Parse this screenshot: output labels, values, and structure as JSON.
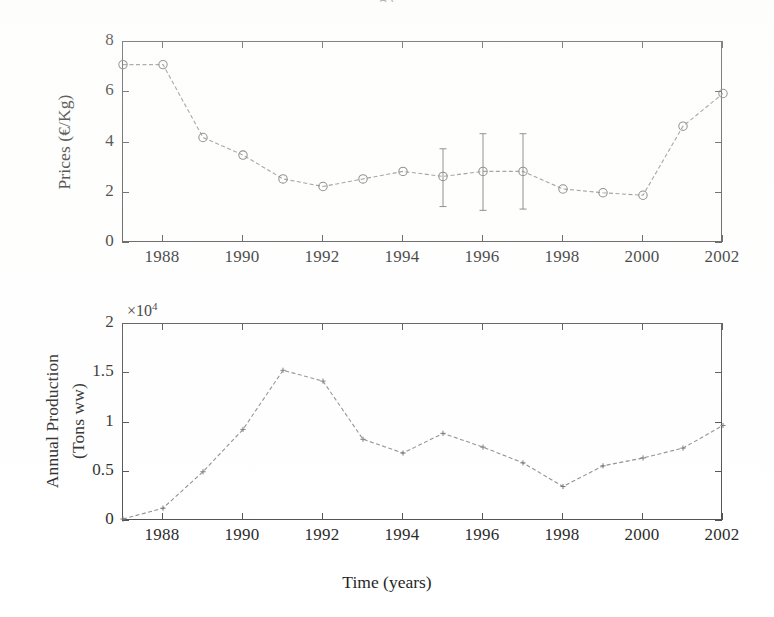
{
  "figure": {
    "top_caption_fragment": "g         (",
    "background_color": "#ffffff",
    "line_color": "#8a8a8a",
    "marker_color": "#6f6f6f",
    "axis_color": "#4a4a4a"
  },
  "chart_data": [
    {
      "id": "prices",
      "type": "line",
      "title": "",
      "xlabel": "",
      "ylabel": "Prices (€/Kg)",
      "ylim": [
        0,
        8
      ],
      "xlim": [
        1987,
        2002
      ],
      "grid": false,
      "legend": null,
      "ytick_labels": [
        "0",
        "2",
        "4",
        "6",
        "8"
      ],
      "ytick_values": [
        0,
        2,
        4,
        6,
        8
      ],
      "xtick_labels": [
        "1988",
        "1990",
        "1992",
        "1994",
        "1996",
        "1998",
        "2000",
        "2002"
      ],
      "xtick_values": [
        1988,
        1990,
        1992,
        1994,
        1996,
        1998,
        2000,
        2002
      ],
      "marker": "open-circle",
      "linestyle": "dashed",
      "x": [
        1987,
        1988,
        1989,
        1990,
        1991,
        1992,
        1993,
        1994,
        1995,
        1996,
        1997,
        1998,
        1999,
        2000,
        2001,
        2002
      ],
      "values": [
        7.1,
        7.1,
        4.2,
        3.5,
        2.55,
        2.25,
        2.55,
        2.85,
        2.65,
        2.85,
        2.85,
        2.15,
        2.0,
        1.9,
        4.65,
        5.95
      ],
      "error_bars": [
        {
          "x": 1995,
          "y": 2.65,
          "lower": 1.45,
          "upper": 3.75
        },
        {
          "x": 1996,
          "y": 2.85,
          "lower": 1.3,
          "upper": 4.35
        },
        {
          "x": 1997,
          "y": 2.85,
          "lower": 1.35,
          "upper": 4.35
        }
      ]
    },
    {
      "id": "annual-production",
      "type": "line",
      "title": "",
      "xlabel": "Time (years)",
      "ylabel": "Annual Production\n(Tons ww)",
      "ylabel_line1": "Annual Production",
      "ylabel_line2": "(Tons ww)",
      "y_multiplier": "×10",
      "y_multiplier_exp": "4",
      "ylim": [
        0,
        2
      ],
      "xlim": [
        1987,
        2002
      ],
      "grid": false,
      "legend": null,
      "ytick_labels": [
        "0",
        "0.5",
        "1",
        "1.5",
        "2"
      ],
      "ytick_values": [
        0,
        0.5,
        1,
        1.5,
        2
      ],
      "xtick_labels": [
        "1988",
        "1990",
        "1992",
        "1994",
        "1996",
        "1998",
        "2000",
        "2002"
      ],
      "xtick_values": [
        1988,
        1990,
        1992,
        1994,
        1996,
        1998,
        2000,
        2002
      ],
      "marker": "small-dot",
      "linestyle": "dashed",
      "x": [
        1987,
        1988,
        1989,
        1990,
        1991,
        1992,
        1993,
        1994,
        1995,
        1996,
        1997,
        1998,
        1999,
        2000,
        2001,
        2002
      ],
      "values": [
        0.02,
        0.13,
        0.5,
        0.93,
        1.53,
        1.42,
        0.83,
        0.69,
        0.89,
        0.75,
        0.59,
        0.35,
        0.56,
        0.64,
        0.74,
        0.97
      ]
    }
  ]
}
